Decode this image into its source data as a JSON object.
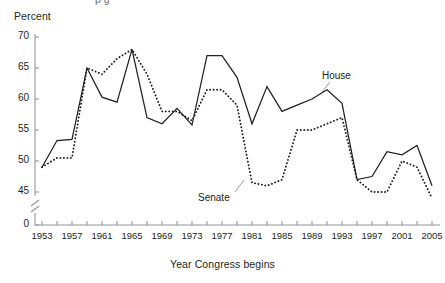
{
  "figure": {
    "partial_top_text": "p g",
    "y_axis_title": "Percent",
    "x_axis_title": "Year Congress begins"
  },
  "labels": {
    "house": "House",
    "senate": "Senate"
  },
  "axis": {
    "y_ticks": [
      "70",
      "65",
      "60",
      "55",
      "50",
      "45",
      "0"
    ],
    "x_ticks": [
      "1953",
      "1957",
      "1961",
      "1965",
      "1969",
      "1973",
      "1977",
      "1981",
      "1985",
      "1989",
      "1993",
      "1997",
      "2001",
      "2005"
    ],
    "y_break": "axis-break-symbol"
  },
  "chart_data": {
    "type": "line",
    "title": "",
    "xlabel": "Year Congress begins",
    "ylabel": "Percent",
    "xlim": [
      1953,
      2005
    ],
    "ylim": [
      43,
      70
    ],
    "grid": false,
    "legend": "inline-annotations",
    "x": [
      1953,
      1955,
      1957,
      1959,
      1961,
      1963,
      1965,
      1967,
      1969,
      1971,
      1973,
      1975,
      1977,
      1979,
      1981,
      1983,
      1985,
      1987,
      1989,
      1991,
      1993,
      1995,
      1997,
      1999,
      2001,
      2003,
      2005
    ],
    "series": [
      {
        "name": "House",
        "style": "solid",
        "color": "#231f20",
        "values": [
          49.0,
          53.3,
          53.5,
          65.0,
          60.3,
          59.5,
          68.0,
          57.0,
          56.0,
          58.5,
          55.8,
          67.0,
          67.0,
          63.5,
          56.0,
          62.0,
          58.0,
          59.0,
          60.0,
          61.5,
          59.3,
          47.0,
          47.5,
          51.5,
          51.0,
          52.5,
          46.0
        ]
      },
      {
        "name": "Senate",
        "style": "dotted",
        "color": "#231f20",
        "values": [
          49.0,
          50.5,
          50.5,
          65.0,
          64.0,
          66.5,
          68.0,
          64.0,
          58.0,
          58.0,
          56.5,
          61.5,
          61.5,
          59.0,
          46.5,
          46.0,
          47.0,
          55.0,
          55.0,
          56.0,
          57.0,
          47.0,
          45.0,
          45.0,
          50.0,
          49.0,
          44.0
        ]
      }
    ]
  }
}
